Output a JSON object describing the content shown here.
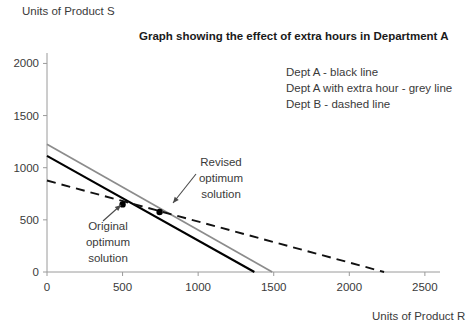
{
  "chart_data": {
    "type": "line",
    "title": "Graph showing the effect of extra hours in Department A",
    "xlabel": "Units of Product R",
    "ylabel": "Units of Product S",
    "xlim": [
      0,
      2600
    ],
    "ylim": [
      0,
      2100
    ],
    "xticks": [
      0,
      500,
      1000,
      1500,
      2000,
      2500
    ],
    "xtick_labels": [
      "0",
      "500",
      "1000",
      "1500",
      "2000",
      "2500"
    ],
    "yticks": [
      0,
      500,
      1000,
      1500,
      2000
    ],
    "ytick_labels": [
      "0",
      "500",
      "1000",
      "1500",
      "2000"
    ],
    "grid": false,
    "legend_position": "upper-right",
    "series": [
      {
        "name": "Dept A - black line",
        "style": "solid",
        "color": "#000000",
        "points": [
          [
            0,
            1114
          ],
          [
            1372,
            0
          ]
        ]
      },
      {
        "name": "Dept A with extra hour - grey line",
        "style": "solid",
        "color": "#8c8c8c",
        "points": [
          [
            0,
            1224
          ],
          [
            1490,
            0
          ]
        ]
      },
      {
        "name": "Dept B - dashed line",
        "style": "dashed",
        "color": "#111111",
        "points": [
          [
            0,
            877
          ],
          [
            2230,
            0
          ]
        ]
      }
    ],
    "markers": [
      {
        "name": "original-optimum",
        "x": 500,
        "y": 648
      },
      {
        "name": "revised-optimum",
        "x": 745,
        "y": 575
      }
    ],
    "annotations": [
      {
        "name": "original-optimum",
        "lines": [
          "Original",
          "optimum",
          "solution"
        ],
        "text_x": 108,
        "text_y": 230,
        "arrow_from": [
          103,
          221
        ],
        "arrow_to": [
          121,
          205
        ]
      },
      {
        "name": "revised-optimum",
        "lines": [
          "Revised",
          "optimum",
          "solution"
        ],
        "text_x": 221,
        "text_y": 166,
        "arrow_from": [
          196,
          174
        ],
        "arrow_to": [
          173,
          203
        ]
      }
    ]
  },
  "legend": {
    "items": [
      "Dept A - black line",
      "Dept A with extra hour - grey line",
      "Dept B - dashed line"
    ]
  }
}
